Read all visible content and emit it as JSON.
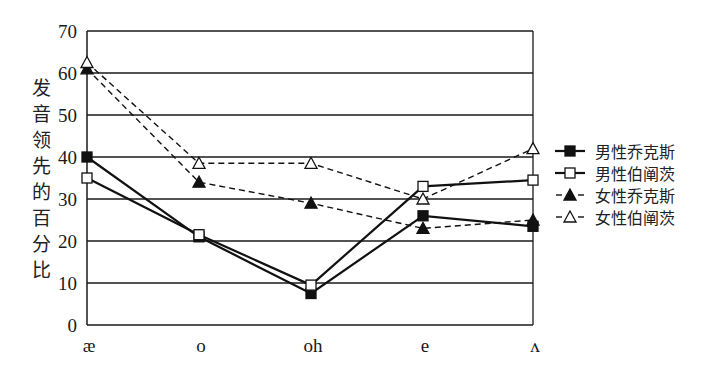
{
  "chart_data": {
    "type": "line",
    "title": "",
    "xlabel": "",
    "ylabel": "发音领先的百分比",
    "categories": [
      "æ",
      "o",
      "oh",
      "e",
      "ʌ"
    ],
    "ylim": [
      0,
      70
    ],
    "yticks": [
      0,
      10,
      20,
      30,
      40,
      50,
      60,
      70
    ],
    "grid": true,
    "legend_position": "right",
    "series": [
      {
        "name": "男性乔克斯",
        "marker": "filled-square",
        "line": "solid",
        "values": [
          40,
          21,
          7.5,
          26,
          23.5
        ]
      },
      {
        "name": "男性伯阐茨",
        "marker": "open-square",
        "line": "solid",
        "values": [
          35,
          21.5,
          9.5,
          33,
          34.5
        ]
      },
      {
        "name": "女性乔克斯",
        "marker": "filled-triangle",
        "line": "dashed",
        "values": [
          61,
          34,
          29,
          23,
          25
        ]
      },
      {
        "name": "女性伯阐茨",
        "marker": "open-triangle",
        "line": "dashed",
        "values": [
          62.5,
          38.5,
          38.5,
          30,
          42
        ]
      }
    ]
  },
  "ylabel_chars": [
    "发",
    "音",
    "领",
    "先",
    "的",
    "百",
    "分",
    "比"
  ],
  "colors": {
    "line": "#1a1a1a",
    "grid": "#1a1a1a",
    "background": "#ffffff"
  }
}
